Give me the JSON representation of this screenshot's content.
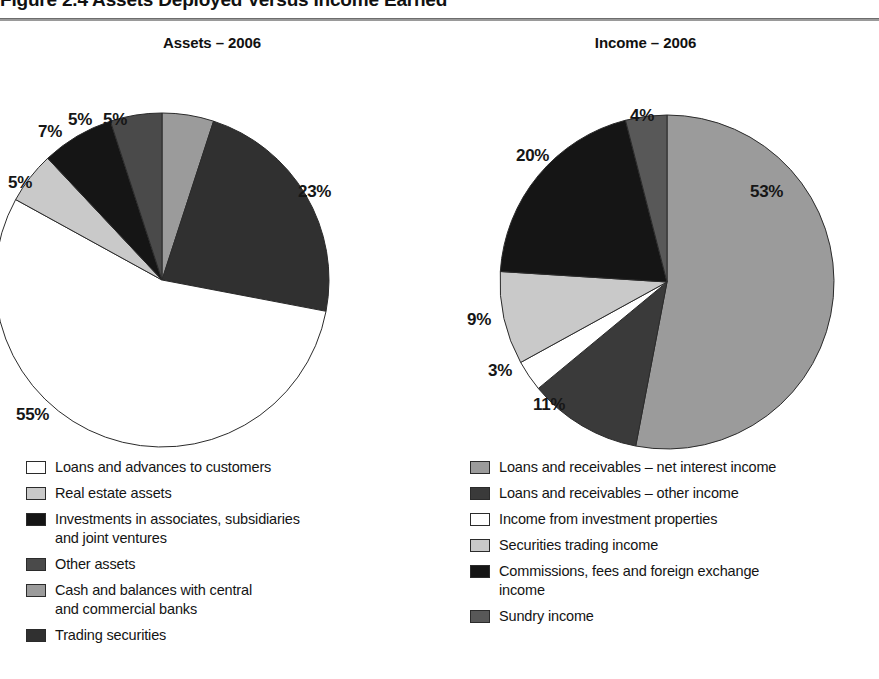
{
  "figure": {
    "title": "Figure 2.4 Assets Deployed Versus Income Earned"
  },
  "palette": {
    "white": "#ffffff",
    "light_gray": "#c9c9c9",
    "mid_gray": "#9b9b9b",
    "mid_dark_gray": "#6e6e6e",
    "dark_gray": "#4a4a4a",
    "black": "#151515",
    "outline": "#2b2b2b"
  },
  "panels": [
    {
      "id": "assets",
      "title": "Assets – 2006",
      "legend": [
        {
          "label": "Loans and advances to customers",
          "color": "#ffffff"
        },
        {
          "label": "Real estate assets",
          "color": "#c9c9c9"
        },
        {
          "label": "Investments in associates, subsidiaries",
          "label_cont": "and joint ventures",
          "color": "#151515"
        },
        {
          "label": "Other assets",
          "color": "#4a4a4a"
        },
        {
          "label": "Cash and balances with central",
          "label_cont": "and commercial banks",
          "color": "#9b9b9b"
        },
        {
          "label": "Trading securities",
          "color": "#303030"
        }
      ]
    },
    {
      "id": "income",
      "title": "Income – 2006",
      "legend": [
        {
          "label": "Loans and receivables – net interest income",
          "color": "#9b9b9b"
        },
        {
          "label": "Loans and receivables – other income",
          "color": "#3a3a3a"
        },
        {
          "label": "Income from investment properties",
          "color": "#ffffff"
        },
        {
          "label": "Securities trading income",
          "color": "#c9c9c9"
        },
        {
          "label": "Commissions, fees and foreign exchange",
          "label_cont": "income",
          "color": "#151515"
        },
        {
          "label": "Sundry income",
          "color": "#585858"
        }
      ]
    }
  ],
  "chart_data": [
    {
      "type": "pie",
      "title": "Assets – 2006",
      "id": "assets",
      "unit": "percent",
      "start_angle_deg": 0,
      "direction": "clockwise",
      "categories": [
        "Cash and balances with central and commercial banks",
        "Trading securities",
        "Loans and advances to customers",
        "Real estate assets",
        "Investments in associates, subsidiaries and joint ventures",
        "Other assets"
      ],
      "values": [
        5,
        23,
        55,
        5,
        7,
        5
      ],
      "data_labels": [
        "5%",
        "23%",
        "55%",
        "5%",
        "7%",
        "5%"
      ],
      "slice_colors": [
        "#9b9b9b",
        "#303030",
        "#ffffff",
        "#c9c9c9",
        "#151515",
        "#4a4a4a"
      ],
      "legend_position": "bottom-left"
    },
    {
      "type": "pie",
      "title": "Income – 2006",
      "id": "income",
      "unit": "percent",
      "start_angle_deg": 0,
      "direction": "clockwise",
      "categories": [
        "Loans and receivables – net interest income",
        "Loans and receivables – other income",
        "Income from investment properties",
        "Securities trading income",
        "Commissions, fees and foreign exchange income",
        "Sundry income"
      ],
      "values": [
        53,
        11,
        3,
        9,
        20,
        4
      ],
      "data_labels": [
        "53%",
        "11%",
        "3%",
        "9%",
        "20%",
        "4%"
      ],
      "slice_colors": [
        "#9b9b9b",
        "#3a3a3a",
        "#ffffff",
        "#c9c9c9",
        "#151515",
        "#585858"
      ],
      "legend_position": "bottom-right"
    }
  ],
  "labels": {
    "assets": {
      "p_cash": "5%",
      "p_trading": "23%",
      "p_loans": "55%",
      "p_realestate": "5%",
      "p_investments": "7%",
      "p_other": "5%"
    },
    "income": {
      "p_netinterest": "53%",
      "p_otherincome": "11%",
      "p_investprop": "3%",
      "p_securities": "9%",
      "p_commissions": "20%",
      "p_sundry": "4%"
    }
  }
}
